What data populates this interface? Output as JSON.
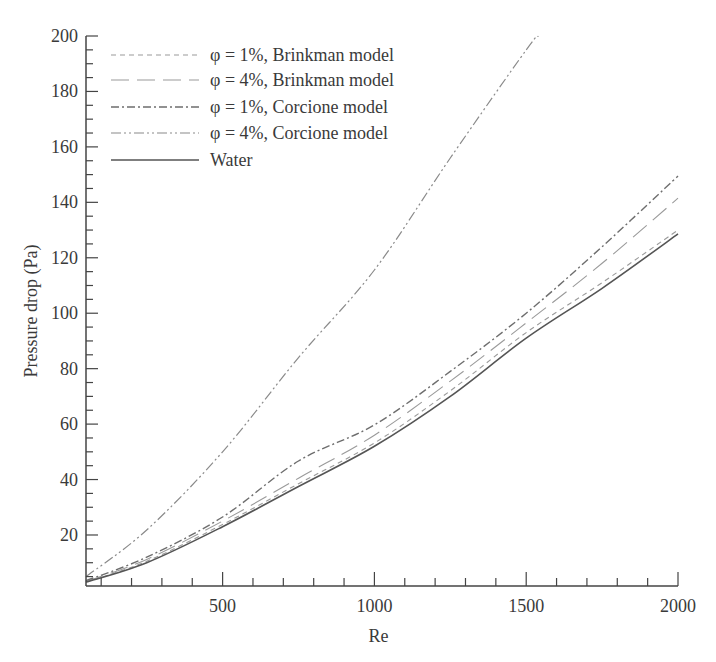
{
  "chart_data": {
    "type": "line",
    "title": "",
    "xlabel": "Re",
    "ylabel": "Pressure drop (Pa)",
    "xlim": [
      50,
      2000
    ],
    "ylim": [
      1.6,
      200
    ],
    "grid": false,
    "legend_position": "top-left",
    "x_ticks_major": [
      500,
      1000,
      1500,
      2000
    ],
    "x_ticks_minor_step": 100,
    "y_ticks_major": [
      20,
      40,
      60,
      80,
      100,
      120,
      140,
      160,
      180,
      200
    ],
    "y_ticks_minor_step": 5,
    "series": [
      {
        "name": "φ = 1%, Brinkman model",
        "style": "dashed-fine",
        "color": "#9a9a9a",
        "x": [
          50,
          250,
          500,
          750,
          1000,
          1250,
          1500,
          1750,
          2000
        ],
        "values": [
          3.0,
          10.5,
          23.8,
          38.5,
          53.2,
          72,
          93,
          111,
          130
        ]
      },
      {
        "name": "φ = 4%, Brinkman model",
        "style": "dashed-long",
        "color": "#9a9a9a",
        "x": [
          50,
          250,
          500,
          750,
          1000,
          1250,
          1500,
          1750,
          2000
        ],
        "values": [
          3.2,
          11.2,
          25,
          40.5,
          56,
          75.5,
          96.5,
          118,
          141.5
        ]
      },
      {
        "name": "φ = 1%, Corcione model",
        "style": "dash-dot",
        "color": "#6e6e6e",
        "x": [
          50,
          250,
          500,
          750,
          1000,
          1250,
          1500,
          1750,
          2000
        ],
        "values": [
          3.5,
          12,
          26.5,
          46.7,
          59.7,
          79,
          100,
          124,
          149.5
        ]
      },
      {
        "name": "φ = 4%, Corcione model",
        "style": "dash-dot-dot",
        "color": "#8a8a8a",
        "x": [
          50,
          250,
          500,
          750,
          1000,
          1250,
          1500,
          1540
        ],
        "values": [
          5,
          21.8,
          50,
          84,
          115.6,
          156,
          195,
          200
        ]
      },
      {
        "name": "Water",
        "style": "solid",
        "color": "#555555",
        "x": [
          50,
          250,
          500,
          750,
          1000,
          1250,
          1500,
          1750,
          2000
        ],
        "values": [
          3.0,
          10,
          23,
          37.5,
          52,
          70,
          91,
          109,
          128.6
        ]
      }
    ]
  }
}
